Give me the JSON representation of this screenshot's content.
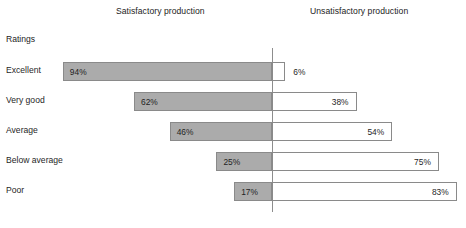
{
  "headings": {
    "left": "Satisfactory production",
    "right": "Unsatisfactory production"
  },
  "axis_label": "Ratings",
  "chart_data": {
    "type": "bar",
    "subtype": "diverging-stacked-bar",
    "title": "",
    "xlabel": "",
    "ylabel": "Ratings",
    "categories": [
      "Excellent",
      "Very good",
      "Average",
      "Below average",
      "Poor"
    ],
    "series": [
      {
        "name": "Satisfactory production",
        "values": [
          94,
          62,
          46,
          25,
          17
        ],
        "labels": [
          "94%",
          "62%",
          "46%",
          "25%",
          "17%"
        ],
        "color": "#ababab"
      },
      {
        "name": "Unsatisfactory production",
        "values": [
          6,
          38,
          54,
          75,
          83
        ],
        "labels": [
          "6%",
          "38%",
          "54%",
          "75%",
          "83%"
        ],
        "color": "#ffffff"
      }
    ],
    "xlim": [
      0,
      100
    ],
    "grid": false,
    "legend": "none",
    "axis_divider_color": "#8d8d8d",
    "bar_border_color": "#8a8a8a"
  },
  "rows": [
    {
      "label": "Excellent",
      "left_value": "94%",
      "right_value": "6%",
      "left_pct": 94,
      "right_pct": 6,
      "right_label_outside": true
    },
    {
      "label": "Very good",
      "left_value": "62%",
      "right_value": "38%",
      "left_pct": 62,
      "right_pct": 38,
      "right_label_outside": false
    },
    {
      "label": "Average",
      "left_value": "46%",
      "right_value": "54%",
      "left_pct": 46,
      "right_pct": 54,
      "right_label_outside": false
    },
    {
      "label": "Below average",
      "left_value": "25%",
      "right_value": "75%",
      "left_pct": 25,
      "right_pct": 75,
      "right_label_outside": false
    },
    {
      "label": "Poor",
      "left_value": "17%",
      "right_value": "83%",
      "left_pct": 17,
      "right_pct": 83,
      "right_label_outside": false
    }
  ],
  "layout": {
    "axis_x": 272,
    "px_per_pct": 2.225,
    "row_top_start": 60,
    "row_spacing": 30
  }
}
